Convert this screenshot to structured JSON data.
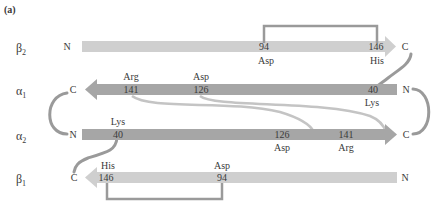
{
  "panel_label": "(a)",
  "colors": {
    "beta_chain": "#cfcfcf",
    "alpha_chain": "#a6a6a6",
    "connector": "#9a9a9a",
    "text": "#3a3a3a"
  },
  "chains": [
    {
      "id": "beta2",
      "name": "β",
      "sub": "2",
      "left_terminus": "N",
      "right_terminus": "C",
      "direction": "right"
    },
    {
      "id": "alpha1",
      "name": "α",
      "sub": "1",
      "left_terminus": "C",
      "right_terminus": "N",
      "direction": "left"
    },
    {
      "id": "alpha2",
      "name": "α",
      "sub": "2",
      "left_terminus": "N",
      "right_terminus": "C",
      "direction": "right"
    },
    {
      "id": "beta1",
      "name": "β",
      "sub": "1",
      "left_terminus": "C",
      "right_terminus": "N",
      "direction": "left"
    }
  ],
  "residues": {
    "beta2_94": {
      "num": "94",
      "name": "Asp"
    },
    "beta2_146": {
      "num": "146",
      "name": "His"
    },
    "alpha1_141": {
      "num": "141",
      "name": "Arg"
    },
    "alpha1_126": {
      "num": "126",
      "name": "Asp"
    },
    "alpha1_40": {
      "num": "40",
      "name": "Lys"
    },
    "alpha2_40": {
      "num": "40",
      "name": "Lys"
    },
    "alpha2_126": {
      "num": "126",
      "name": "Asp"
    },
    "alpha2_141": {
      "num": "141",
      "name": "Arg"
    },
    "beta1_146": {
      "num": "146",
      "name": "His"
    },
    "beta1_94": {
      "num": "94",
      "name": "Asp"
    }
  }
}
